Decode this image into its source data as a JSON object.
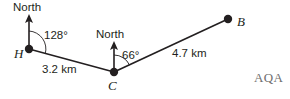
{
  "figure": {
    "type": "bearings-diagram",
    "points": [
      {
        "id": "H",
        "label": "H",
        "x": 29,
        "y": 49
      },
      {
        "id": "C",
        "label": "C",
        "x": 114,
        "y": 72
      },
      {
        "id": "B",
        "label": "B",
        "x": 228,
        "y": 19
      }
    ],
    "north_lines": [
      {
        "at": "H",
        "label": "North",
        "x": 29,
        "top_y": 15,
        "bottom_y": 49
      },
      {
        "at": "C",
        "label": "North",
        "x": 114,
        "top_y": 42,
        "bottom_y": 72
      }
    ],
    "segments": [
      {
        "from": "H",
        "to": "C",
        "label": "3.2 km"
      },
      {
        "from": "C",
        "to": "B",
        "label": "4.7 km"
      }
    ],
    "angles": [
      {
        "at": "H",
        "label": "128°",
        "value": 128,
        "from": "north",
        "to": "C"
      },
      {
        "at": "C",
        "label": "66°",
        "value": 66,
        "from": "north",
        "to": "B"
      }
    ],
    "brand": "AQA",
    "colors": {
      "ink": "#231f20",
      "brand": "#6e6e6e",
      "background": "#ffffff"
    }
  }
}
